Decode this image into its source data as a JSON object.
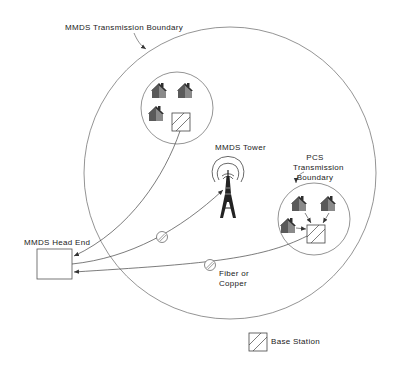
{
  "diagram": {
    "labels": {
      "mmds_boundary": "MMDS Transmission Boundary",
      "mmds_tower": "MMDS Tower",
      "pcs_boundary_line1": "PCS",
      "pcs_boundary_line2": "Transmission",
      "pcs_boundary_line3": "Boundary",
      "head_end": "MMDS Head End",
      "link_line1": "Fiber or",
      "link_line2": "Copper",
      "legend_base_station": "Base Station"
    },
    "nodes": [
      {
        "id": "mmds-head-end",
        "type": "box",
        "label": "MMDS Head End"
      },
      {
        "id": "mmds-tower",
        "type": "tower",
        "label": "MMDS Tower"
      },
      {
        "id": "cell-upper",
        "type": "cell",
        "houses": 3,
        "base_station": true
      },
      {
        "id": "cell-pcs",
        "type": "cell",
        "houses": 3,
        "base_station": true,
        "label": "PCS Transmission Boundary"
      }
    ],
    "edges": [
      {
        "from": "mmds-head-end",
        "to": "mmds-tower",
        "style": "arrow",
        "via_splice": true
      },
      {
        "from": "cell-upper",
        "to": "mmds-head-end",
        "style": "arrow"
      },
      {
        "from": "cell-pcs",
        "to": "mmds-head-end",
        "style": "arrow",
        "via_splice": true,
        "label": "Fiber or Copper"
      },
      {
        "from": "houses",
        "to": "pcs-base-station",
        "style": "arrow",
        "count": 3
      }
    ],
    "legend": [
      {
        "symbol": "hatched-square",
        "label": "Base Station"
      }
    ],
    "colors": {
      "line": "#555555",
      "house_roof": "#3a3a3a",
      "house_wall": "#8a8a8a",
      "text": "#222222"
    }
  }
}
